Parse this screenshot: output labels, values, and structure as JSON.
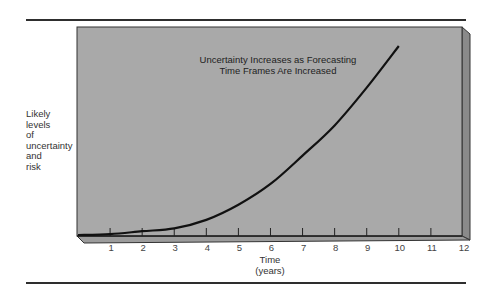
{
  "chart_data": {
    "type": "line",
    "title": "Uncertainty Increases as Forecasting Time Frames Are Increased",
    "title_lines": [
      "Uncertainty Increases as Forecasting",
      "Time Frames Are Increased"
    ],
    "xlabel": "Time (years)",
    "xlabel_lines": [
      "Time",
      "(years)"
    ],
    "ylabel": "Likely levels of uncertainty and risk",
    "ylabel_lines": [
      "Likely",
      "levels",
      "of",
      "uncertainty",
      "and",
      "risk"
    ],
    "x_ticks": [
      "1",
      "2",
      "3",
      "4",
      "5",
      "6",
      "7",
      "8",
      "9",
      "10",
      "11",
      "12"
    ],
    "xlim": [
      0,
      12
    ],
    "ylim": [
      0,
      100
    ],
    "grid": false,
    "legend": null,
    "series": [
      {
        "name": "Uncertainty and risk",
        "x": [
          0,
          1,
          2,
          3,
          4,
          5,
          6,
          7,
          8,
          9,
          10
        ],
        "y": [
          0,
          0.5,
          2,
          3.5,
          8,
          16,
          27,
          42,
          58,
          78,
          100
        ]
      }
    ],
    "colors": {
      "panel": "#a9a9a9",
      "panel_side": "#8a8a8a",
      "curve": "#111111",
      "rule": "#2e2e2e"
    }
  }
}
